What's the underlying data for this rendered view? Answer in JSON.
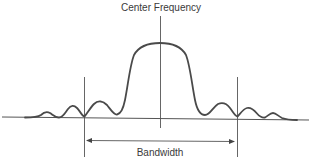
{
  "diagram": {
    "title": "Center Frequency",
    "bandwidth_label": "Bandwidth",
    "colors": {
      "stroke": "#4a4a4a",
      "text": "#3a3a3a",
      "background": "#ffffff"
    },
    "elements": {
      "center_frequency_marker": "vertical line at center of main lobe",
      "bandwidth_markers": [
        "left vertical boundary",
        "right vertical boundary"
      ],
      "bandwidth_arrow": "double-headed horizontal arrow between boundaries",
      "signal_curve": "sinc-like spectrum: tall main lobe with diminishing side lobes",
      "baseline": "horizontal frequency axis"
    }
  }
}
